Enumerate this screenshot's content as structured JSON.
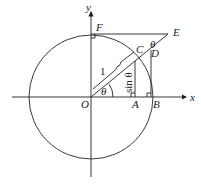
{
  "diagram": {
    "type": "unit-circle-trigonometry",
    "axes": {
      "x_label": "x",
      "y_label": "y"
    },
    "points": {
      "origin": "O",
      "A": "A",
      "B": "B",
      "C": "C",
      "D": "D",
      "E": "E",
      "F": "F"
    },
    "angle_labels": {
      "at_origin": "θ",
      "at_E": "θ"
    },
    "segment_labels": {
      "radius": "1",
      "opposite": "sin θ"
    },
    "colors": {
      "stroke": "#222222",
      "background": "#ffffff"
    }
  }
}
